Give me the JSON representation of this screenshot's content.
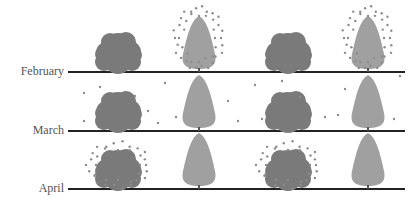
{
  "rows": [
    {
      "label": "February",
      "line_y": 72,
      "pollen": "conifer"
    },
    {
      "label": "March",
      "line_y": 131,
      "pollen": "scattered"
    },
    {
      "label": "April",
      "line_y": 189,
      "pollen": "broadleaf"
    }
  ],
  "colors": {
    "broadleaf": "#7a7a7a",
    "conifer": "#a0a0a0",
    "pollen": "#8c8c8c",
    "ground": "#222222",
    "label": "#555555"
  },
  "trees": [
    {
      "type": "broadleaf",
      "x": 118
    },
    {
      "type": "conifer",
      "x": 199
    },
    {
      "type": "broadleaf",
      "x": 288
    },
    {
      "type": "conifer",
      "x": 368
    }
  ]
}
